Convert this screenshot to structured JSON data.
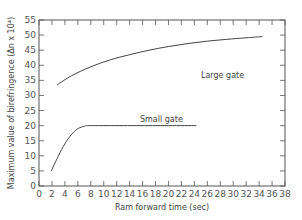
{
  "chart_data": {
    "type": "line",
    "title": "",
    "xlabel": "Ram forward time (sec)",
    "ylabel": "Maximum value of birefringence (Δn x 10⁴)",
    "xlim": [
      0,
      38
    ],
    "ylim": [
      0,
      55
    ],
    "x_ticks": [
      0,
      2,
      4,
      6,
      8,
      10,
      12,
      14,
      16,
      18,
      20,
      22,
      24,
      26,
      28,
      30,
      32,
      34,
      36,
      38
    ],
    "y_ticks": [
      0,
      5,
      10,
      15,
      20,
      25,
      30,
      35,
      40,
      45,
      50,
      55
    ],
    "grid": false,
    "legend": "inline curve labels",
    "series": [
      {
        "name": "Large gate",
        "x": [
          2.8,
          5,
          8,
          11,
          14,
          17,
          20,
          23,
          26,
          29,
          32,
          34.5
        ],
        "y": [
          33.5,
          36.5,
          39.5,
          41.8,
          43.5,
          45.0,
          46.2,
          47.2,
          48.0,
          48.6,
          49.1,
          49.5
        ]
      },
      {
        "name": "Small gate",
        "x": [
          1.9,
          3,
          4,
          5,
          6,
          7,
          7.5,
          10,
          15,
          20,
          24.3
        ],
        "y": [
          5,
          10,
          14,
          17,
          19,
          19.8,
          20,
          20,
          20,
          20,
          20
        ]
      }
    ]
  },
  "labels": {
    "large_gate": "Large gate",
    "small_gate": "Small gate",
    "xlabel": "Ram forward time (sec)",
    "ylabel": "Maximum value of birefringence (Δn x 10⁴)"
  }
}
